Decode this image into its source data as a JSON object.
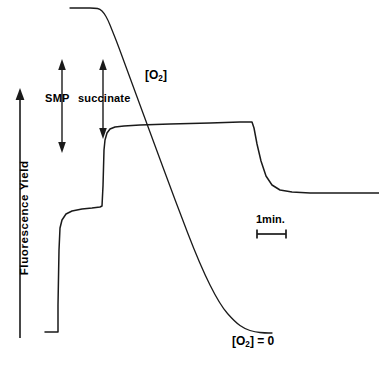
{
  "figure": {
    "background_color": "#ffffff",
    "line_color": "#1a1a1a",
    "width": 379,
    "height": 370
  },
  "axes": {
    "y_axis_label": "Fluorescence  Yield",
    "y_axis_arrow": "up-arrow",
    "y_axis_arrow_top_y": 90,
    "y_axis_arrow_bottom_y": 338
  },
  "annotations": {
    "smp_label": "SMP",
    "succinate_label": "succinate",
    "oxygen_trace_label_prefix": "[O",
    "oxygen_trace_label_sub": "2",
    "oxygen_trace_label_suffix": "]",
    "oxygen_zero_label_suffix": "] = 0",
    "scale_bar_label": "1min."
  },
  "chart_data": {
    "type": "line",
    "xlabel": "",
    "ylabel": "Fluorescence  Yield",
    "grid": false,
    "legend": "none",
    "xlim": [
      0,
      379
    ],
    "ylim": [
      370,
      0
    ],
    "axis_units": "arbitrary (pixel coordinates, y inverted: lower value = higher yield)",
    "scale_bar": {
      "label": "1min.",
      "x_start": 256,
      "x_end": 287,
      "y": 234,
      "cap_height": 8
    },
    "event_markers": [
      {
        "name": "SMP",
        "label": "SMP",
        "type": "double-headed-vertical-arrow",
        "x": 62,
        "y_top": 60,
        "y_bottom": 152
      },
      {
        "name": "succinate",
        "label": "succinate",
        "type": "double-headed-vertical-arrow",
        "x": 103,
        "y_top": 60,
        "y_bottom": 138
      }
    ],
    "series": [
      {
        "name": "Fluorescence Yield",
        "label": "fluorescence-trace",
        "points": [
          [
            45,
            332
          ],
          [
            58,
            332
          ],
          [
            58,
            305
          ],
          [
            59,
            250
          ],
          [
            60,
            228
          ],
          [
            62,
            220
          ],
          [
            66,
            214
          ],
          [
            72,
            211
          ],
          [
            82,
            209
          ],
          [
            92,
            208
          ],
          [
            100,
            207
          ],
          [
            102,
            206
          ],
          [
            103,
            186
          ],
          [
            104,
            150
          ],
          [
            105,
            140
          ],
          [
            107,
            133
          ],
          [
            110,
            129
          ],
          [
            115,
            127
          ],
          [
            124,
            126
          ],
          [
            140,
            125
          ],
          [
            170,
            124
          ],
          [
            210,
            123
          ],
          [
            240,
            122
          ],
          [
            252,
            122
          ],
          [
            254,
            128
          ],
          [
            257,
            144
          ],
          [
            261,
            161
          ],
          [
            266,
            176
          ],
          [
            272,
            185
          ],
          [
            280,
            190
          ],
          [
            292,
            192
          ],
          [
            310,
            193
          ],
          [
            340,
            193
          ],
          [
            379,
            193
          ]
        ]
      },
      {
        "name": "[O2]",
        "label": "oxygen-trace",
        "points": [
          [
            70,
            8
          ],
          [
            85,
            8
          ],
          [
            95,
            8
          ],
          [
            100,
            9
          ],
          [
            104,
            13
          ],
          [
            108,
            20
          ],
          [
            112,
            30
          ],
          [
            118,
            45
          ],
          [
            130,
            78
          ],
          [
            150,
            132
          ],
          [
            175,
            200
          ],
          [
            200,
            265
          ],
          [
            220,
            305
          ],
          [
            235,
            322
          ],
          [
            245,
            329
          ],
          [
            255,
            332
          ],
          [
            265,
            333
          ],
          [
            272,
            333
          ]
        ]
      }
    ],
    "annotations_on_plot": [
      {
        "text": "[O2]",
        "x": 145,
        "y": 76,
        "name": "oxygen-label"
      },
      {
        "text": "[O2] = 0",
        "x": 232,
        "y": 343,
        "name": "oxygen-zero-label"
      },
      {
        "text": "1min.",
        "x": 256,
        "y": 221,
        "name": "scale-bar-label"
      }
    ]
  }
}
